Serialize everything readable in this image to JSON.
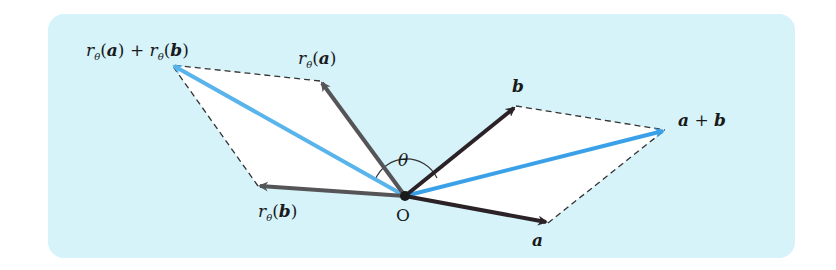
{
  "figure": {
    "type": "vector rotation diagram",
    "origin_label": "O",
    "angle_label": "θ",
    "vectors": [
      {
        "name": "a",
        "label": "a",
        "color": "#2a2226",
        "tip": [
          548,
          223
        ]
      },
      {
        "name": "b",
        "label": "b",
        "color": "#2a2226",
        "tip": [
          516,
          106
        ]
      },
      {
        "name": "a+b",
        "label": "a + b",
        "color": "#3aa0e8",
        "tip": [
          665,
          130
        ]
      },
      {
        "name": "r_theta(a)",
        "label": "rθ(a)",
        "color": "#555558",
        "tip": [
          320,
          81
        ]
      },
      {
        "name": "r_theta(b)",
        "label": "rθ(b)",
        "color": "#555558",
        "tip": [
          258,
          186
        ]
      },
      {
        "name": "r_theta(a)+r_theta(b)",
        "label": "rθ(a) + rθ(b)",
        "color": "#5ab4ec",
        "tip": [
          172,
          65
        ]
      }
    ],
    "origin": [
      405,
      196
    ],
    "colors": {
      "panel_bg": "#d6f3fa",
      "parallelogram_fill": "#ffffff",
      "dashed": "#333333"
    }
  },
  "labels": {
    "r": "r",
    "theta_sub": "θ",
    "a": "a",
    "b": "b",
    "plus": "+",
    "open": "(",
    "close": ")",
    "O": "O",
    "theta": "θ"
  }
}
